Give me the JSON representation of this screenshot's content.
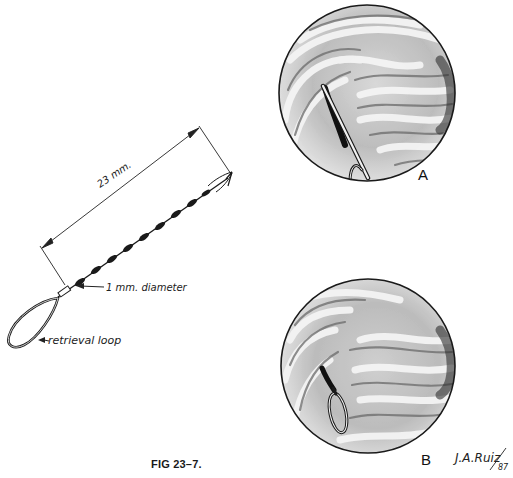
{
  "figure": {
    "caption": "FIG 23–7.",
    "instrument": {
      "length_label": "23 mm.",
      "diameter_label": "1 mm. diameter",
      "loop_label": "retrieval loop"
    },
    "panels": [
      {
        "label": "A",
        "description": "endoscopic view with instrument shaft inserted into tissue"
      },
      {
        "label": "B",
        "description": "endoscopic view with retrieval loop visible"
      }
    ],
    "signature": "J.A.Ruiz",
    "signature_year": "87"
  },
  "colors": {
    "ink": "#1a1a1a",
    "background": "#ffffff",
    "tissue_light": "#eeeeee",
    "tissue_mid": "#9a9a9a",
    "tissue_dark": "#3a3a3a"
  }
}
